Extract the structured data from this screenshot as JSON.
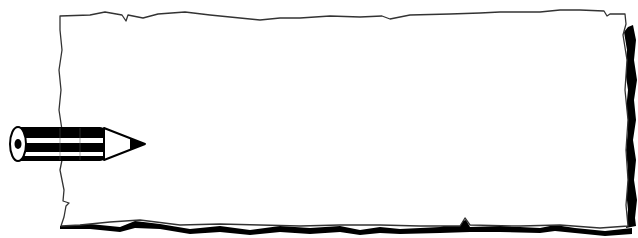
{
  "image": {
    "description": "Torn paper banner with pencil clip art",
    "width": 638,
    "height": 238
  },
  "paper": {
    "fill_color": "#ffffff",
    "outline_color": "#333333",
    "shadow_color": "#000000",
    "content_text": ""
  },
  "pencil": {
    "body_color": "#000000",
    "stripe_color": "#ffffff",
    "tip_color": "#000000",
    "direction": "right"
  },
  "top_caption": {
    "text": "",
    "note": "cropped, illegible"
  }
}
